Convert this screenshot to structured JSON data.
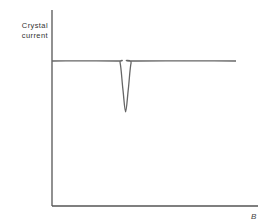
{
  "chart_data": {
    "type": "line",
    "title": "",
    "xlabel": "B",
    "ylabel_lines": [
      "Crystal",
      "current"
    ],
    "ylabel": "Crystal current",
    "axis_ticks": "none",
    "grid": false,
    "legend": "none",
    "series": [
      {
        "name": "Crystal current",
        "x": [
          0.0,
          0.35,
          0.37,
          0.385,
          0.4,
          0.415,
          0.43,
          0.45,
          1.0
        ],
        "y": [
          0.74,
          0.74,
          0.73,
          0.6,
          0.48,
          0.6,
          0.73,
          0.74,
          0.74
        ]
      }
    ],
    "xlim": [
      0,
      1.0
    ],
    "ylim": [
      0,
      1.0
    ],
    "colors": {
      "axis": "#555555",
      "line": "#666666",
      "text": "#333333"
    }
  }
}
